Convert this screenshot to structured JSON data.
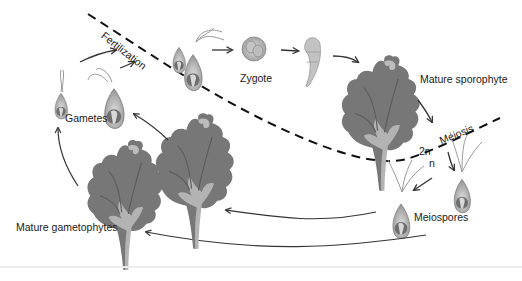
{
  "diagram": {
    "labels": {
      "fertilization": "Fertilization",
      "zygote": "Zygote",
      "mature_sporophyte": "Mature sporophyte",
      "meiosis": "Meiosis",
      "ploidy_diploid": "2n",
      "ploidy_haploid": "n",
      "meiospores": "Meiospores",
      "mature_gametophytes": "Mature gametophytes",
      "gametes": "Gametes"
    },
    "colors": {
      "background": "#ffffff",
      "thallus_dark": "#6f6f6f",
      "thallus_light": "#a9a9a9",
      "cell_body": "#bdbdbd",
      "arrow": "#333333",
      "divider": "#111111",
      "text": "#1a1a1a"
    },
    "stages": [
      {
        "name": "Gametes",
        "ploidy": "n"
      },
      {
        "name": "Fertilization",
        "ploidy": "transition"
      },
      {
        "name": "Zygote",
        "ploidy": "2n"
      },
      {
        "name": "Mature sporophyte",
        "ploidy": "2n"
      },
      {
        "name": "Meiosis",
        "ploidy": "transition"
      },
      {
        "name": "Meiospores",
        "ploidy": "n"
      },
      {
        "name": "Mature gametophytes",
        "ploidy": "n"
      }
    ]
  }
}
